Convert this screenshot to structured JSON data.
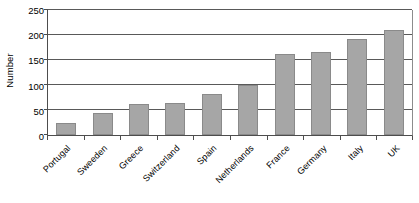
{
  "chart_data": {
    "type": "bar",
    "title": "",
    "subtitle": "",
    "xlabel": "",
    "ylabel": "Number",
    "ylim": [
      0,
      250
    ],
    "y_ticks": [
      0,
      50,
      100,
      150,
      200,
      250
    ],
    "grid": true,
    "legend": false,
    "categories": [
      "Portugal",
      "Sweeden",
      "Greece",
      "Switzerland",
      "Spain",
      "Netherlands",
      "France",
      "Germany",
      "Italy",
      "UK"
    ],
    "values": [
      25,
      45,
      62,
      65,
      82,
      100,
      162,
      167,
      193,
      211
    ],
    "bar_color": "#a6a6a6",
    "bar_border_color": "#8a8a8a",
    "axis_color": "#4d4d4d",
    "gridline_color": "#595959"
  }
}
